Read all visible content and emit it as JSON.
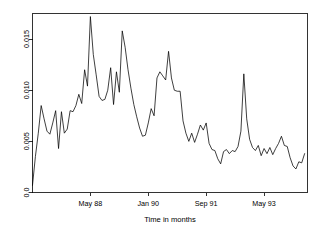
{
  "chart_data": {
    "type": "line",
    "title": "",
    "subtitle": "",
    "xlabel": "Time in months",
    "ylabel": "",
    "grid": false,
    "legend": false,
    "legend_position": "none",
    "line_color": "#000000",
    "background_color": "#ffffff",
    "axis_color": "#000000",
    "xlim": [
      0,
      95
    ],
    "ylim": [
      0.0,
      0.0175
    ],
    "x_tick_labels": [
      "May 88",
      "Jan 90",
      "Sep 91",
      "May 93"
    ],
    "x_tick_positions": [
      20,
      40,
      60,
      80
    ],
    "y_tick_labels": [
      "0.0",
      "0.005",
      "0.010",
      "0.015"
    ],
    "y_tick_values": [
      0.0,
      0.005,
      0.01,
      0.015
    ],
    "x_start_label": "Sep 86",
    "x": [
      0,
      1,
      2,
      3,
      4,
      5,
      6,
      7,
      8,
      9,
      10,
      11,
      12,
      13,
      14,
      15,
      16,
      17,
      18,
      19,
      20,
      21,
      22,
      23,
      24,
      25,
      26,
      27,
      28,
      29,
      30,
      31,
      32,
      33,
      34,
      35,
      36,
      37,
      38,
      39,
      40,
      41,
      42,
      43,
      44,
      45,
      46,
      47,
      48,
      49,
      50,
      51,
      52,
      53,
      54,
      55,
      56,
      57,
      58,
      59,
      60,
      61,
      62,
      63,
      64,
      65,
      66,
      67,
      68,
      69,
      70,
      71,
      72,
      73,
      74,
      75,
      76,
      77,
      78,
      79,
      80,
      81,
      82,
      83,
      84,
      85,
      86,
      87,
      88,
      89,
      90,
      91,
      92,
      93,
      94
    ],
    "values": [
      0.0007,
      0.0035,
      0.0058,
      0.0085,
      0.0072,
      0.006,
      0.0057,
      0.0068,
      0.008,
      0.0043,
      0.0079,
      0.0058,
      0.0062,
      0.008,
      0.0079,
      0.0085,
      0.0096,
      0.0087,
      0.012,
      0.0104,
      0.0172,
      0.0135,
      0.0115,
      0.0094,
      0.009,
      0.0091,
      0.01,
      0.0122,
      0.0086,
      0.0118,
      0.0098,
      0.0158,
      0.0142,
      0.012,
      0.0102,
      0.0086,
      0.0074,
      0.0063,
      0.0055,
      0.0056,
      0.0068,
      0.0082,
      0.0075,
      0.0112,
      0.0118,
      0.0114,
      0.011,
      0.0138,
      0.0112,
      0.01,
      0.0099,
      0.0099,
      0.007,
      0.0058,
      0.005,
      0.0058,
      0.0049,
      0.0057,
      0.0066,
      0.0061,
      0.0068,
      0.0048,
      0.0042,
      0.0041,
      0.0033,
      0.0028,
      0.004,
      0.0042,
      0.0038,
      0.0041,
      0.004,
      0.0045,
      0.006,
      0.0116,
      0.0072,
      0.0052,
      0.0044,
      0.0041,
      0.0046,
      0.0036,
      0.0043,
      0.0038,
      0.0044,
      0.0037,
      0.0043,
      0.0048,
      0.0055,
      0.0046,
      0.0045,
      0.0034,
      0.0026,
      0.0023,
      0.003,
      0.0029,
      0.0038
    ]
  }
}
